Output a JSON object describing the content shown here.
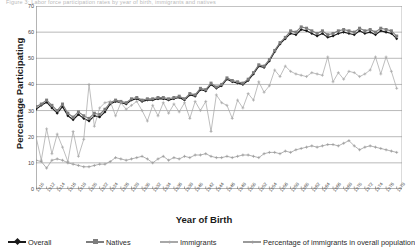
{
  "top_fragment": "Figure 3: Labor force participation rates by year of birth, immigrants and natives",
  "axes": {
    "y_title": "Percentage Participating",
    "x_title": "Year of Birth",
    "y_ticks": [
      0,
      10,
      20,
      30,
      40,
      50,
      60,
      70
    ],
    "x_ticks": [
      1910,
      1912,
      1914,
      1916,
      1918,
      1920,
      1922,
      1924,
      1926,
      1928,
      1930,
      1932,
      1934,
      1936,
      1938,
      1940,
      1942,
      1944,
      1946,
      1948,
      1950,
      1952,
      1954,
      1956,
      1958,
      1960,
      1962,
      1964,
      1966,
      1968,
      1970,
      1972,
      1974,
      1976,
      1978
    ]
  },
  "legend": {
    "items": [
      {
        "label": "Overall",
        "marker": "diamond",
        "color": "#1a1a1a"
      },
      {
        "label": "Natives",
        "marker": "square",
        "color": "#7d7d7d"
      },
      {
        "label": "Immigrants",
        "marker": "plus",
        "color": "#a8a8a8"
      },
      {
        "label": "Percentage of immigrants in overall population",
        "marker": "plus",
        "color": "#9a9a9a"
      }
    ]
  },
  "chart_data": {
    "type": "line",
    "title": "",
    "xlabel": "Year of Birth",
    "ylabel": "Percentage Participating",
    "xlim": [
      1910,
      1979
    ],
    "ylim": [
      0,
      70
    ],
    "grid": true,
    "legend_position": "bottom",
    "x": [
      1910,
      1911,
      1912,
      1913,
      1914,
      1915,
      1916,
      1917,
      1918,
      1919,
      1920,
      1921,
      1922,
      1923,
      1924,
      1925,
      1926,
      1927,
      1928,
      1929,
      1930,
      1931,
      1932,
      1933,
      1934,
      1935,
      1936,
      1937,
      1938,
      1939,
      1940,
      1941,
      1942,
      1943,
      1944,
      1945,
      1946,
      1947,
      1948,
      1949,
      1950,
      1951,
      1952,
      1953,
      1954,
      1955,
      1956,
      1957,
      1958,
      1959,
      1960,
      1961,
      1962,
      1963,
      1964,
      1965,
      1966,
      1967,
      1968,
      1969,
      1970,
      1971,
      1972,
      1973,
      1974,
      1975,
      1976,
      1977,
      1978
    ],
    "series": [
      {
        "name": "Overall",
        "color": "#1a1a1a",
        "marker": "diamond",
        "values": [
          30.5,
          32.0,
          33.2,
          31.0,
          29.0,
          31.5,
          28.0,
          26.5,
          28.5,
          27.0,
          26.0,
          28.0,
          27.5,
          29.5,
          32.5,
          33.5,
          33.0,
          32.5,
          34.0,
          34.5,
          33.5,
          34.0,
          34.0,
          34.5,
          34.5,
          34.0,
          34.5,
          35.0,
          34.0,
          36.0,
          35.5,
          38.0,
          37.5,
          40.0,
          38.5,
          39.5,
          42.0,
          41.0,
          40.5,
          40.0,
          41.5,
          44.0,
          47.0,
          46.5,
          49.0,
          52.5,
          55.5,
          57.5,
          59.5,
          59.0,
          61.0,
          60.5,
          59.5,
          58.5,
          59.5,
          58.0,
          58.5,
          59.5,
          60.0,
          59.5,
          59.0,
          60.5,
          59.5,
          60.0,
          59.0,
          60.5,
          60.0,
          59.5,
          57.5
        ]
      },
      {
        "name": "Natives",
        "color": "#7d7d7d",
        "marker": "square",
        "values": [
          31.5,
          32.5,
          34.0,
          32.0,
          30.0,
          32.5,
          29.0,
          27.5,
          29.5,
          28.0,
          27.0,
          29.0,
          28.5,
          30.5,
          33.0,
          34.0,
          33.5,
          33.0,
          34.5,
          35.0,
          34.0,
          34.5,
          34.5,
          35.0,
          35.0,
          34.5,
          35.0,
          35.5,
          34.5,
          36.5,
          36.0,
          38.5,
          38.0,
          40.5,
          39.0,
          40.0,
          42.5,
          41.5,
          41.0,
          40.5,
          42.0,
          44.5,
          47.5,
          47.0,
          49.5,
          53.0,
          56.0,
          58.0,
          60.5,
          60.0,
          62.0,
          61.5,
          60.5,
          59.5,
          60.5,
          59.0,
          59.5,
          60.5,
          61.0,
          60.5,
          60.0,
          61.5,
          60.5,
          61.0,
          60.0,
          61.5,
          61.0,
          60.5,
          58.5
        ]
      },
      {
        "name": "Immigrants",
        "color": "#a8a8a8",
        "marker": "plus",
        "values": [
          20.0,
          11.0,
          23.0,
          13.5,
          21.0,
          16.0,
          10.5,
          22.0,
          12.5,
          19.0,
          40.0,
          24.0,
          31.0,
          33.0,
          33.5,
          28.0,
          33.0,
          30.5,
          32.0,
          33.5,
          30.0,
          26.0,
          32.0,
          28.0,
          33.0,
          29.0,
          32.5,
          29.5,
          33.0,
          27.0,
          33.5,
          30.0,
          33.5,
          22.0,
          36.0,
          33.0,
          32.0,
          27.0,
          34.0,
          31.0,
          36.5,
          34.0,
          41.0,
          37.0,
          39.5,
          45.5,
          43.0,
          47.0,
          45.0,
          44.0,
          43.5,
          43.0,
          44.5,
          44.0,
          43.5,
          50.5,
          41.0,
          44.5,
          42.0,
          45.0,
          44.5,
          43.0,
          44.0,
          45.5,
          50.5,
          44.0,
          50.5,
          45.0,
          38.5
        ]
      },
      {
        "name": "Percentage of immigrants in overall population",
        "color": "#9a9a9a",
        "marker": "plus",
        "values": [
          11.0,
          10.5,
          8.0,
          11.0,
          11.5,
          11.0,
          10.0,
          9.5,
          9.0,
          8.5,
          8.5,
          9.0,
          9.5,
          9.5,
          10.5,
          12.0,
          11.5,
          11.0,
          11.5,
          12.0,
          12.5,
          11.5,
          10.0,
          11.5,
          12.5,
          11.0,
          12.0,
          11.5,
          12.5,
          12.0,
          13.0,
          13.0,
          13.5,
          12.5,
          12.0,
          12.0,
          12.5,
          12.0,
          12.5,
          13.0,
          13.0,
          12.5,
          12.0,
          13.5,
          14.0,
          14.0,
          13.5,
          14.5,
          14.0,
          15.0,
          15.5,
          16.0,
          16.5,
          16.0,
          16.5,
          17.0,
          17.0,
          16.5,
          17.5,
          18.5,
          16.5,
          15.0,
          16.0,
          16.5,
          16.0,
          15.5,
          15.0,
          14.5,
          14.0
        ]
      }
    ]
  }
}
